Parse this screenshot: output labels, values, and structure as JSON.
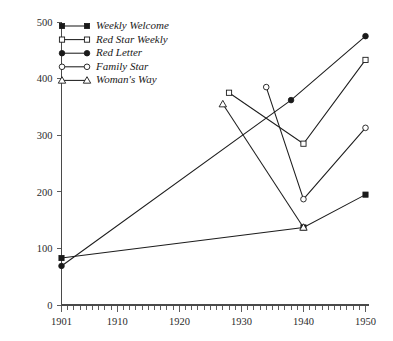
{
  "chart_data": {
    "type": "line",
    "title": "",
    "xlabel": "",
    "ylabel": "",
    "xlim": [
      1901,
      1950
    ],
    "ylim": [
      0,
      500
    ],
    "grid": false,
    "legend_position": "top-left",
    "x_ticks": [
      1901,
      1910,
      1920,
      1930,
      1940,
      1950
    ],
    "x_tick_labels": [
      "1901",
      "1910",
      "1920",
      "1930",
      "1940",
      "1950"
    ],
    "x_minor_tick_step": 1,
    "y_ticks": [
      0,
      100,
      200,
      300,
      400,
      500
    ],
    "y_tick_labels": [
      "0",
      "100",
      "200",
      "300",
      "400",
      "500"
    ],
    "series": [
      {
        "name": "Weekly Welcome",
        "marker": "filled-square",
        "points": [
          {
            "x": 1901,
            "y": 83
          },
          {
            "x": 1940,
            "y": 137
          },
          {
            "x": 1950,
            "y": 195
          }
        ]
      },
      {
        "name": "Red Star Weekly",
        "marker": "open-square",
        "points": [
          {
            "x": 1928,
            "y": 375
          },
          {
            "x": 1940,
            "y": 285
          },
          {
            "x": 1950,
            "y": 433
          }
        ]
      },
      {
        "name": "Red Letter",
        "marker": "filled-circle",
        "points": [
          {
            "x": 1901,
            "y": 69
          },
          {
            "x": 1938,
            "y": 362
          },
          {
            "x": 1950,
            "y": 475
          }
        ]
      },
      {
        "name": "Family Star",
        "marker": "open-circle",
        "points": [
          {
            "x": 1934,
            "y": 385
          },
          {
            "x": 1940,
            "y": 187
          },
          {
            "x": 1950,
            "y": 313
          }
        ]
      },
      {
        "name": "Woman's Way",
        "marker": "open-triangle",
        "points": [
          {
            "x": 1927,
            "y": 355
          },
          {
            "x": 1940,
            "y": 137
          }
        ]
      }
    ]
  },
  "legend": {
    "entries": [
      {
        "label": "Weekly Welcome",
        "marker": "filled-square"
      },
      {
        "label": "Red Star Weekly",
        "marker": "open-square"
      },
      {
        "label": "Red Letter",
        "marker": "filled-circle"
      },
      {
        "label": "Family Star",
        "marker": "open-circle"
      },
      {
        "label": "Woman's Way",
        "marker": "open-triangle"
      }
    ]
  },
  "colors": {
    "ink": "#1a1a1a",
    "axis": "#4a4a4a",
    "background": "#ffffff"
  }
}
